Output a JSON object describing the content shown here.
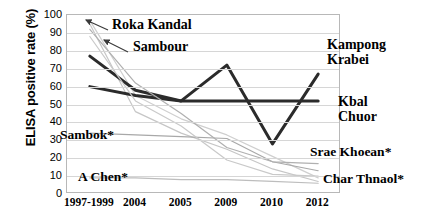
{
  "chart_data": {
    "type": "line",
    "title": "",
    "xlabel": "",
    "ylabel": "ELISA positive rate (%)",
    "categories": [
      "1997-1999",
      "2004",
      "2005",
      "2009",
      "2010",
      "2012"
    ],
    "ylim": [
      0,
      100
    ],
    "yticks": [
      0,
      10,
      20,
      30,
      40,
      50,
      60,
      70,
      80,
      90,
      100
    ],
    "grid": true,
    "legend": "none (direct labels with leader arrows)",
    "series": [
      {
        "name": "Roka Kandal",
        "style": "light-gray",
        "color": "#cfcfcf",
        "values": [
          97,
          55,
          42,
          33,
          21,
          9
        ]
      },
      {
        "name": "Sambour",
        "style": "light-gray",
        "color": "#c6c6c6",
        "values": [
          95,
          46,
          34,
          25,
          14,
          7
        ]
      },
      {
        "name": "Kampong Krabei",
        "style": "dark",
        "color": "#2b2b2b",
        "values": [
          77,
          58,
          52,
          72,
          28,
          67
        ]
      },
      {
        "name": "Kbal Chuor",
        "style": "dark",
        "color": "#2b2b2b",
        "values": [
          60,
          55,
          52,
          52,
          52,
          52
        ]
      },
      {
        "name": "Sambok*",
        "style": "light-gray",
        "color": "#a8a8a8",
        "values": [
          34,
          33,
          32,
          31,
          18,
          13
        ]
      },
      {
        "name": "Srae Khoean*",
        "style": "light-gray",
        "color": "#b0b0b0",
        "values": [
          92,
          62,
          45,
          26,
          18,
          17
        ]
      },
      {
        "name": "A Chen*",
        "style": "light-gray",
        "color": "#bdbdbd",
        "values": [
          9,
          9,
          8,
          8,
          7,
          6
        ]
      },
      {
        "name": "Char Thnaol*",
        "style": "light-gray",
        "color": "#c9c9c9",
        "values": [
          88,
          52,
          38,
          19,
          11,
          10
        ]
      }
    ],
    "annotations": [
      {
        "label": "Roka Kandal",
        "has_arrow": true
      },
      {
        "label": "Sambour",
        "has_arrow": true
      },
      {
        "label": "Kampong Krabei",
        "has_arrow": false
      },
      {
        "label": "Kbal Chuor",
        "has_arrow": false
      },
      {
        "label": "Sambok*",
        "has_arrow": false
      },
      {
        "label": "Srae Khoean*",
        "has_arrow": false
      },
      {
        "label": "A Chen*",
        "has_arrow": false
      },
      {
        "label": "Char Thnaol*",
        "has_arrow": false
      }
    ]
  },
  "labels": {
    "roka_kandal": "Roka Kandal",
    "sambour": "Sambour",
    "kampong": "Kampong",
    "krabei": "Krabei",
    "kbal": "Kbal",
    "chuor": "Chuor",
    "sambok": "Sambok*",
    "srae_khoean": "Srae Khoean*",
    "a_chen": "A Chen*",
    "char_thnaol": "Char Thnaol*"
  }
}
